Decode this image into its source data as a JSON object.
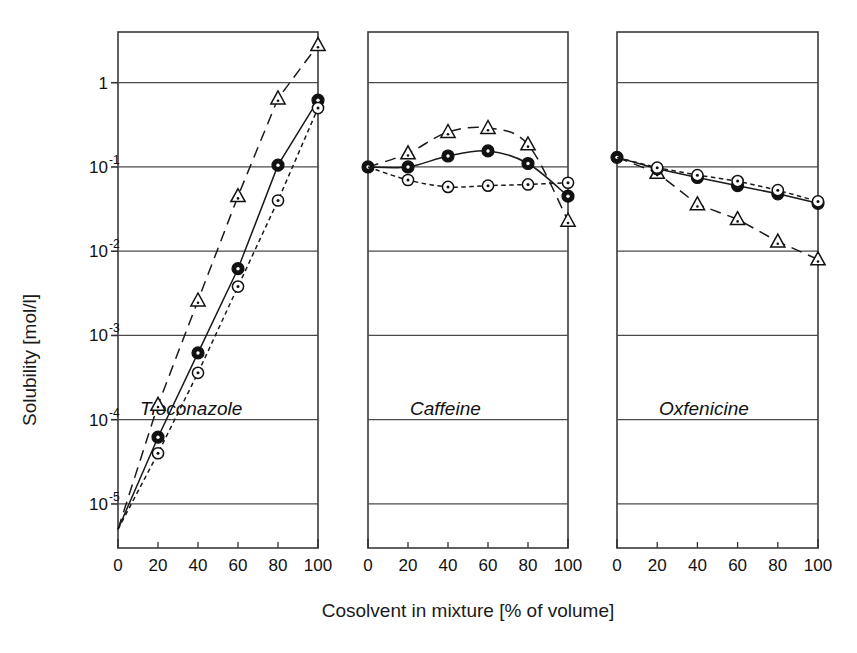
{
  "figure": {
    "background": "#ffffff",
    "ink_color": "#111111"
  },
  "axes": {
    "y_title": "Solubility [mol/l]",
    "x_title": "Cosolvent in mixture [% of volume]",
    "y_tick_labels": [
      "1",
      "10-1",
      "10-2",
      "10-3",
      "10-4",
      "10-5"
    ],
    "y_tick_mantissa": [
      "1",
      "10",
      "10",
      "10",
      "10",
      "10"
    ],
    "y_tick_exponent": [
      "",
      "-1",
      "-2",
      "-3",
      "-4",
      "-5"
    ],
    "y_tick_values": [
      1,
      0.1,
      0.01,
      0.001,
      0.0001,
      1e-05
    ],
    "x_tick_labels": [
      "0",
      "20",
      "40",
      "60",
      "80",
      "100"
    ],
    "x_tick_values": [
      0,
      20,
      40,
      60,
      80,
      100
    ]
  },
  "chart_data": {
    "type": "line",
    "title": "",
    "subtitle": "",
    "xlabel": "Cosolvent in mixture [% of volume]",
    "ylabel": "Solubility [mol/l]",
    "yscale": "log",
    "ylim": [
      3e-06,
      4.0
    ],
    "xlim": [
      0,
      100
    ],
    "grid": true,
    "grid_axis": "y",
    "legend": "none",
    "legend_position": "none",
    "panel_layout": "1x3 side-by-side, shared y-axis, separate x-axes",
    "series_styles": [
      {
        "name": "series-triangle",
        "marker": "open-triangle",
        "line": "long-dash",
        "color": "#111111"
      },
      {
        "name": "series-filled-circle",
        "marker": "filled-circle-white-dot",
        "line": "solid",
        "color": "#111111"
      },
      {
        "name": "series-open-circle",
        "marker": "open-circle-dot",
        "line": "short-dash",
        "color": "#111111"
      }
    ],
    "panels": [
      {
        "label": "Tioconazole",
        "x": [
          0,
          20,
          40,
          60,
          80,
          100
        ],
        "series": [
          {
            "name": "series-triangle",
            "marker": "open-triangle",
            "line": "long-dash",
            "values": [
              5e-06,
              0.00015,
              0.0026,
              0.045,
              0.65,
              2.8
            ]
          },
          {
            "name": "series-filled-circle",
            "marker": "filled-circle-white-dot",
            "line": "solid",
            "values": [
              5e-06,
              6.2e-05,
              0.00062,
              0.0062,
              0.105,
              0.62
            ]
          },
          {
            "name": "series-open-circle",
            "marker": "open-circle-dot",
            "line": "short-dash",
            "values": [
              5e-06,
              4e-05,
              0.00036,
              0.0038,
              0.04,
              0.5
            ]
          }
        ]
      },
      {
        "label": "Caffeine",
        "x": [
          0,
          20,
          40,
          60,
          80,
          100
        ],
        "series": [
          {
            "name": "series-triangle",
            "marker": "open-triangle",
            "line": "long-dash",
            "values": [
              0.1,
              0.145,
              0.26,
              0.29,
              0.185,
              0.023
            ]
          },
          {
            "name": "series-filled-circle",
            "marker": "filled-circle-white-dot",
            "line": "solid",
            "values": [
              0.1,
              0.1,
              0.135,
              0.155,
              0.11,
              0.045
            ]
          },
          {
            "name": "series-open-circle",
            "marker": "open-circle-dot",
            "line": "short-dash",
            "values": [
              0.1,
              0.07,
              0.058,
              0.06,
              0.062,
              0.065
            ]
          }
        ]
      },
      {
        "label": "Oxfenicine",
        "x": [
          0,
          20,
          40,
          60,
          80,
          100
        ],
        "series": [
          {
            "name": "series-triangle",
            "marker": "open-triangle",
            "line": "long-dash",
            "values": [
              0.13,
              0.085,
              0.036,
              0.024,
              0.013,
              0.008
            ]
          },
          {
            "name": "series-filled-circle",
            "marker": "filled-circle-white-dot",
            "line": "solid",
            "values": [
              0.13,
              0.095,
              0.075,
              0.06,
              0.048,
              0.037
            ]
          },
          {
            "name": "series-open-circle",
            "marker": "open-circle-dot",
            "line": "short-dash",
            "values": [
              0.13,
              0.098,
              0.08,
              0.068,
              0.053,
              0.039
            ]
          }
        ]
      }
    ]
  }
}
